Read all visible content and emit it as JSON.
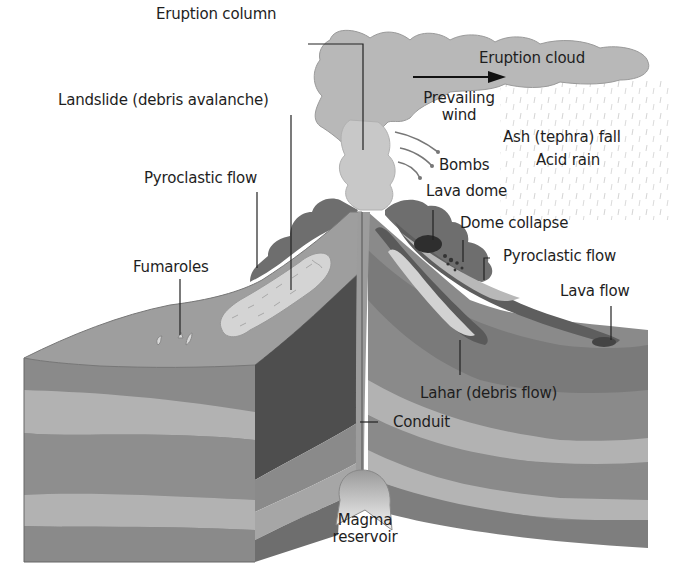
{
  "diagram": {
    "colors": {
      "cloud": "#b8b8b8",
      "dark_flank": "#6e6e6e",
      "mid_layer": "#8e8e8e",
      "light_layer": "#b0b0b0",
      "darkest": "#4a4a4a",
      "magma_light": "#e6e6e6",
      "text": "#1e1e1e"
    },
    "labels": {
      "eruption_column": "Eruption column",
      "eruption_cloud": "Eruption cloud",
      "landslide": "Landslide (debris avalanche)",
      "prevailing_wind_1": "Prevailing",
      "prevailing_wind_2": "wind",
      "ash_fall": "Ash (tephra) fall",
      "acid_rain": "Acid rain",
      "bombs": "Bombs",
      "pyroclastic_flow_left": "Pyroclastic flow",
      "lava_dome": "Lava dome",
      "dome_collapse": "Dome collapse",
      "pyroclastic_flow_right": "Pyroclastic flow",
      "fumaroles": "Fumaroles",
      "lava_flow": "Lava flow",
      "lahar": "Lahar (debris flow)",
      "conduit": "Conduit",
      "magma_1": "Magma",
      "magma_2": "reservoir"
    }
  }
}
